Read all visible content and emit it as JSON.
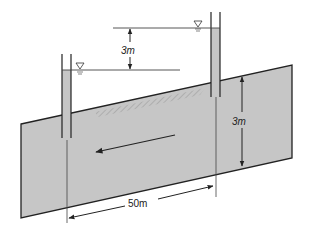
{
  "diagram": {
    "type": "confined aquifer with two piezometers",
    "labels": {
      "head_difference": "3m",
      "aquifer_thickness": "3m",
      "well_spacing": "50m"
    },
    "symbols": {
      "water_table_marker": "inverted-triangle-water-level-icon"
    },
    "colors": {
      "aquifer_fill": "#c4c4c4",
      "line": "#222222",
      "tube_fill": "#c4c4c4",
      "background": "#ffffff"
    },
    "annotations": {
      "flow_direction": "toward lower head (leftward/downslope)"
    }
  }
}
